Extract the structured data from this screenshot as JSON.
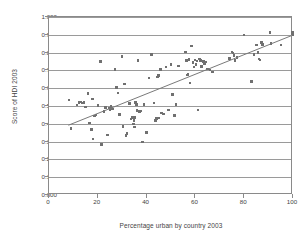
{
  "chart_data": {
    "type": "scatter",
    "title": "",
    "xlabel": "Percentage urban by country 2003",
    "ylabel": "Score of HDI 2003",
    "xlim": [
      0,
      100
    ],
    "ylim": [
      0.0,
      1.0
    ],
    "xticks": [
      "0",
      "20",
      "40",
      "60",
      "80",
      "100"
    ],
    "xtick_values": [
      0,
      20,
      40,
      60,
      80,
      100
    ],
    "yticks": [
      "0.000",
      "0.100",
      "0.200",
      "0.300",
      "0.400",
      "0.500",
      "0.600",
      "0.700",
      "0.800",
      "0.900",
      "1.000"
    ],
    "ytick_values": [
      0.0,
      0.1,
      0.2,
      0.3,
      0.4,
      0.5,
      0.6,
      0.7,
      0.8,
      0.9,
      1.0
    ],
    "grid": "horizontal",
    "legend": "none",
    "marker_color": "#707070",
    "trendline_color": "#777777",
    "axis_color": "#8a8a8a",
    "trendline": {
      "type": "linear",
      "x_start": 8,
      "y_start": 0.385,
      "x_end": 100,
      "y_end": 0.893
    },
    "series": [
      {
        "name": "Countries",
        "points": [
          [
            8.2,
            0.533
          ],
          [
            9.0,
            0.373
          ],
          [
            11.5,
            0.506
          ],
          [
            12.3,
            0.519
          ],
          [
            13.0,
            0.522
          ],
          [
            13.6,
            0.516
          ],
          [
            14.3,
            0.521
          ],
          [
            15.0,
            0.494
          ],
          [
            16.0,
            0.571
          ],
          [
            16.6,
            0.404
          ],
          [
            17.3,
            0.367
          ],
          [
            17.8,
            0.539
          ],
          [
            18.0,
            0.314
          ],
          [
            18.6,
            0.444
          ],
          [
            19.2,
            0.449
          ],
          [
            20.0,
            0.503
          ],
          [
            21.0,
            0.75
          ],
          [
            21.4,
            0.283
          ],
          [
            22.6,
            0.47
          ],
          [
            23.2,
            0.493
          ],
          [
            24.0,
            0.338
          ],
          [
            24.6,
            0.489
          ],
          [
            25.0,
            0.479
          ],
          [
            25.4,
            0.497
          ],
          [
            26.0,
            0.484
          ],
          [
            27.0,
            0.705
          ],
          [
            27.6,
            0.603
          ],
          [
            28.3,
            0.573
          ],
          [
            29.0,
            0.452
          ],
          [
            30.0,
            0.779
          ],
          [
            30.4,
            0.385
          ],
          [
            31.0,
            0.624
          ],
          [
            31.6,
            0.333
          ],
          [
            32.0,
            0.345
          ],
          [
            33.0,
            0.513
          ],
          [
            33.6,
            0.427
          ],
          [
            34.2,
            0.437
          ],
          [
            34.6,
            0.399
          ],
          [
            34.8,
            0.419
          ],
          [
            35.0,
            0.381
          ],
          [
            35.2,
            0.437
          ],
          [
            35.4,
            0.52
          ],
          [
            35.8,
            0.51
          ],
          [
            36.0,
            0.474
          ],
          [
            36.4,
            0.755
          ],
          [
            37.0,
            0.468
          ],
          [
            37.6,
            0.472
          ],
          [
            38.3,
            0.298
          ],
          [
            39.0,
            0.509
          ],
          [
            40.0,
            0.352
          ],
          [
            41.0,
            0.657
          ],
          [
            42.0,
            0.788
          ],
          [
            43.0,
            0.516
          ],
          [
            43.6,
            0.42
          ],
          [
            44.0,
            0.429
          ],
          [
            44.4,
            0.664
          ],
          [
            44.8,
            0.67
          ],
          [
            45.0,
            0.433
          ],
          [
            45.6,
            0.704
          ],
          [
            46.0,
            0.46
          ],
          [
            47.0,
            0.455
          ],
          [
            48.0,
            0.718
          ],
          [
            49.0,
            0.478
          ],
          [
            50.0,
            0.733
          ],
          [
            50.6,
            0.565
          ],
          [
            51.4,
            0.448
          ],
          [
            52.0,
            0.507
          ],
          [
            53.0,
            0.724
          ],
          [
            56.0,
            0.803
          ],
          [
            56.4,
            0.755
          ],
          [
            56.8,
            0.674
          ],
          [
            57.0,
            0.68
          ],
          [
            57.4,
            0.76
          ],
          [
            57.8,
            0.629
          ],
          [
            58.4,
            0.836
          ],
          [
            59.0,
            0.745
          ],
          [
            59.4,
            0.718
          ],
          [
            59.8,
            0.758
          ],
          [
            60.2,
            0.732
          ],
          [
            60.6,
            0.752
          ],
          [
            61.0,
            0.477
          ],
          [
            61.6,
            0.764
          ],
          [
            62.0,
            0.757
          ],
          [
            62.6,
            0.723
          ],
          [
            63.2,
            0.75
          ],
          [
            63.8,
            0.736
          ],
          [
            64.4,
            0.748
          ],
          [
            65.0,
            0.709
          ],
          [
            66.0,
            0.702
          ],
          [
            67.0,
            0.69
          ],
          [
            74.0,
            0.768
          ],
          [
            75.0,
            0.803
          ],
          [
            75.4,
            0.798
          ],
          [
            75.8,
            0.783
          ],
          [
            76.2,
            0.756
          ],
          [
            77.0,
            0.772
          ],
          [
            80.0,
            0.899
          ],
          [
            83.0,
            0.638
          ],
          [
            84.0,
            0.79
          ],
          [
            85.0,
            0.843
          ],
          [
            85.6,
            0.8
          ],
          [
            86.0,
            0.763
          ],
          [
            86.4,
            0.758
          ],
          [
            87.0,
            0.857
          ],
          [
            87.4,
            0.845
          ],
          [
            90.6,
            0.913
          ],
          [
            91.0,
            0.852
          ],
          [
            95.0,
            0.843
          ],
          [
            99.6,
            0.905
          ],
          [
            99.8,
            0.912
          ],
          [
            100.0,
            0.9
          ]
        ]
      }
    ]
  }
}
